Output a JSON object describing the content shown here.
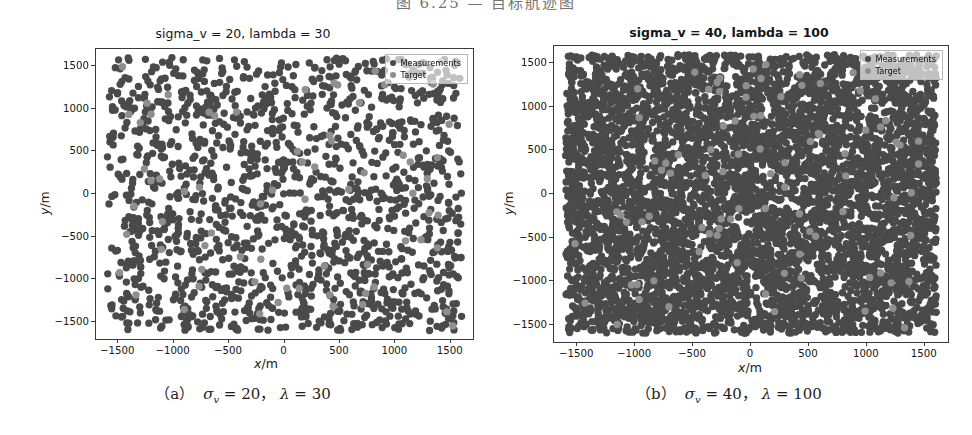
{
  "page": {
    "top_caption": "图 6.25  — 目标航迹图"
  },
  "colors": {
    "measurement": "#4a4a4a",
    "target": "#8f8f8f",
    "frame": "#3a3a3a",
    "text": "#161616"
  },
  "panels": [
    {
      "id": "panel-a",
      "title": "sigma_v = 20, lambda = 30",
      "xlabel_var": "x",
      "xlabel_unit": "/m",
      "ylabel_var": "y",
      "ylabel_unit": "/m",
      "legend": [
        {
          "label": "Measurements",
          "color": "#4a4a4a"
        },
        {
          "label": "Target",
          "color": "#8f8f8f"
        }
      ],
      "caption_index": "（a）",
      "caption_sigma": "σ",
      "caption_sigma_sub": "v",
      "caption_sigma_val": "= 20，",
      "caption_lambda": "λ",
      "caption_lambda_val": "= 30"
    },
    {
      "id": "panel-b",
      "title": "sigma_v = 40, lambda = 100",
      "xlabel_var": "x",
      "xlabel_unit": "/m",
      "ylabel_var": "y",
      "ylabel_unit": "/m",
      "legend": [
        {
          "label": "Measurements",
          "color": "#4a4a4a"
        },
        {
          "label": "Target",
          "color": "#8f8f8f"
        }
      ],
      "caption_index": "（b）",
      "caption_sigma": "σ",
      "caption_sigma_sub": "v",
      "caption_sigma_val": "= 40，",
      "caption_lambda": "λ",
      "caption_lambda_val": "= 100"
    }
  ],
  "chart_data": [
    {
      "type": "scatter",
      "title": "sigma_v = 20, lambda = 30",
      "xlabel": "x/m",
      "ylabel": "y/m",
      "xlim": [
        -1700,
        1700
      ],
      "ylim": [
        -1700,
        1700
      ],
      "xticks": [
        -1500,
        -1000,
        -500,
        0,
        500,
        1000,
        1500
      ],
      "yticks": [
        -1500,
        -1000,
        -500,
        0,
        500,
        1000,
        1500
      ],
      "xtick_labels": [
        "-1500",
        "-1000",
        "-500",
        "0",
        "500",
        "1000",
        "1500"
      ],
      "ytick_labels": [
        "-1500",
        "-1000",
        "-500",
        "0",
        "500",
        "1000",
        "1500"
      ],
      "grid": false,
      "legend_position": "upper right",
      "series": [
        {
          "name": "Measurements",
          "color": "#4a4a4a",
          "marker": "o",
          "marker_size": 7,
          "n_points": 1450,
          "distribution": "uniform clutter over [-1600,1600] x [-1600,1600]",
          "clutter_density_lambda": 30,
          "sigma_v": 20
        },
        {
          "name": "Target",
          "color": "#8f8f8f",
          "marker": "o",
          "marker_size": 7,
          "n_points": 70,
          "distribution": "target track samples spread across the surveillance region"
        }
      ]
    },
    {
      "type": "scatter",
      "title": "sigma_v = 40, lambda = 100",
      "xlabel": "x/m",
      "ylabel": "y/m",
      "xlim": [
        -1700,
        1700
      ],
      "ylim": [
        -1700,
        1700
      ],
      "xticks": [
        -1500,
        -1000,
        -500,
        0,
        500,
        1000,
        1500
      ],
      "yticks": [
        -1500,
        -1000,
        -500,
        0,
        500,
        1000,
        1500
      ],
      "xtick_labels": [
        "-1500",
        "-1000",
        "-500",
        "0",
        "500",
        "1000",
        "1500"
      ],
      "ytick_labels": [
        "-1500",
        "-1000",
        "-500",
        "0",
        "500",
        "1000",
        "1500"
      ],
      "grid": false,
      "legend_position": "upper right",
      "series": [
        {
          "name": "Measurements",
          "color": "#4a4a4a",
          "marker": "o",
          "marker_size": 7,
          "n_points": 5200,
          "distribution": "uniform clutter over [-1600,1600] x [-1600,1600]",
          "clutter_density_lambda": 100,
          "sigma_v": 40
        },
        {
          "name": "Target",
          "color": "#8f8f8f",
          "marker": "o",
          "marker_size": 7,
          "n_points": 90,
          "distribution": "target track samples spread across the surveillance region"
        }
      ]
    }
  ]
}
